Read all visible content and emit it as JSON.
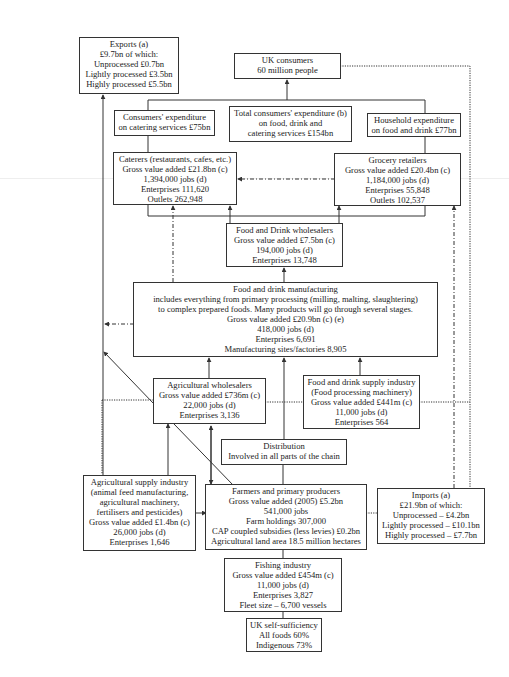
{
  "diagram": {
    "exports": {
      "title": "Exports (a)",
      "lines": [
        "£9.7bn  of which:",
        "Unprocessed £0.7bn",
        "Lightly processed £3.5bn",
        "Highly processed £5.5bn"
      ]
    },
    "uk_consumers": {
      "title": "UK consumers",
      "lines": [
        "60 million people"
      ]
    },
    "catering_expenditure": {
      "lines": [
        "Consumers' expenditure",
        "on catering services £75bn"
      ]
    },
    "total_expenditure": {
      "lines": [
        "Total consumers' expenditure (b)",
        "on food, drink and",
        "catering services £154bn"
      ]
    },
    "household_expenditure": {
      "lines": [
        "Household expenditure",
        "on food and drink £77bn"
      ]
    },
    "caterers": {
      "title": "Caterers (restaurants, cafes, etc.)",
      "lines": [
        "Gross value added £21.8bn (c)",
        "1,394,000 jobs (d)",
        "Enterprises 111,620",
        "Outlets 262,948"
      ]
    },
    "grocery": {
      "title": "Grocery retailers",
      "lines": [
        "Gross value added £20.4bn (c)",
        "1,184,000 jobs (d)",
        "Enterprises 55,848",
        "Outlets 102,537"
      ]
    },
    "wholesalers": {
      "title": "Food and Drink wholesalers",
      "lines": [
        "Gross value added £7.5bn (c)",
        "194,000 jobs (d)",
        "Enterprises 13,748"
      ]
    },
    "manufacturing": {
      "title": "Food and drink manufacturing",
      "lines": [
        "includes everything from primary processing (milling, malting, slaughtering)",
        "to complex prepared foods. Many products will go through several stages.",
        "Gross value added £20.9bn (c) (e)",
        "418,000 jobs (d)",
        "Enterprises 6,691",
        "Manufacturing sites/factories 8,905"
      ]
    },
    "agri_wholesalers": {
      "title": "Agricultural wholesalers",
      "lines": [
        "Gross value added £736m (c)",
        "22,000 jobs (d)",
        "Enterprises 3,136"
      ]
    },
    "supply_industry": {
      "title": "Food and drink supply industry",
      "lines": [
        "(Food processing machinery)",
        "Gross value added £441m (c)",
        "11,000 jobs (d)",
        "Enterprises 564"
      ]
    },
    "distribution": {
      "title": "Distribution",
      "lines": [
        "Involved in all parts of the chain"
      ]
    },
    "agri_supply": {
      "title": "Agricultural supply industry",
      "lines": [
        "(animal feed manufacturing,",
        "agricultural machinery,",
        "fertilisers and pesticides)",
        "Gross value added £1.4bn (c)",
        "26,000 jobs (d)",
        "Enterprises 1,646"
      ]
    },
    "farmers": {
      "title": "Farmers and primary producers",
      "lines": [
        "Gross value added (2005) £5.2bn",
        "541,000 jobs",
        "Farm holdings 307,000",
        "CAP coupled subsidies (less levies) £0.2bn",
        "Agricultural land area 18.5 million hectares"
      ]
    },
    "imports": {
      "title": "Imports (a)",
      "lines": [
        "£21.9bn  of which:",
        "Unprocessed – £4.2bn",
        "Lightly processed – £10.1bn",
        "Highly processed – £7.7bn"
      ]
    },
    "fishing": {
      "title": "Fishing industry",
      "lines": [
        "Gross value added £454m (c)",
        "11,000 jobs (d)",
        "Enterprises 3,827",
        "Fleet size – 6,700 vessels"
      ]
    },
    "self_sufficiency": {
      "title": "UK self-sufficiency",
      "lines": [
        "All foods 60%",
        "Indigenous 73%"
      ]
    }
  },
  "colors": {
    "line": "#333333",
    "background": "#ffffff"
  }
}
